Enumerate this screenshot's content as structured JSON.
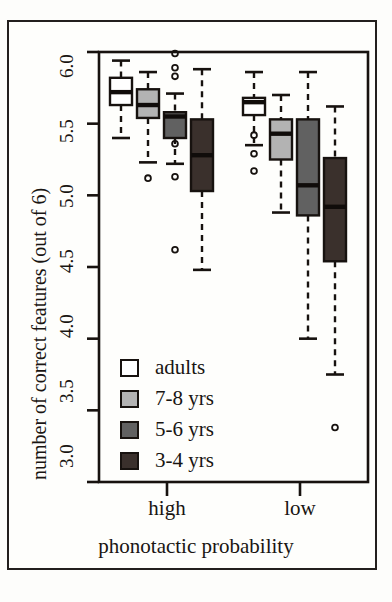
{
  "chart_data": {
    "type": "box",
    "title": "",
    "xlabel": "phonotactic probability",
    "ylabel": "number of correct features (out of 6)",
    "ylim": [
      3.0,
      6.0
    ],
    "yticks": [
      6.0,
      5.5,
      5.0,
      4.5,
      4.0,
      3.5,
      3.0
    ],
    "ytick_labels": [
      "6.0",
      "5.5",
      "5.0",
      "4.5",
      "4.0",
      "3.5",
      "3.0"
    ],
    "categories": [
      "high",
      "low"
    ],
    "grid": false,
    "legend_position": "bottom-left",
    "legend": [
      {
        "label": "adults",
        "color": "#ffffff"
      },
      {
        "label": "7-8 yrs",
        "color": "#b3b3b3"
      },
      {
        "label": "5-6 yrs",
        "color": "#616161"
      },
      {
        "label": "3-4 yrs",
        "color": "#3a302c"
      }
    ],
    "series": [
      {
        "name": "adults",
        "color": "#ffffff",
        "boxes": [
          {
            "category": "high",
            "whisker_low": 5.4,
            "q1": 5.63,
            "median": 5.72,
            "q3": 5.82,
            "whisker_high": 5.94,
            "outliers": []
          },
          {
            "category": "low",
            "whisker_low": 5.35,
            "q1": 5.56,
            "median": 5.65,
            "q3": 5.68,
            "whisker_high": 5.86,
            "outliers": [
              5.42,
              5.29,
              5.17
            ]
          }
        ]
      },
      {
        "name": "7-8 yrs",
        "color": "#b3b3b3",
        "boxes": [
          {
            "category": "high",
            "whisker_low": 5.23,
            "q1": 5.54,
            "median": 5.63,
            "q3": 5.74,
            "whisker_high": 5.86,
            "outliers": [
              5.12
            ]
          },
          {
            "category": "low",
            "whisker_low": 4.88,
            "q1": 5.25,
            "median": 5.43,
            "q3": 5.53,
            "whisker_high": 5.7,
            "outliers": []
          }
        ]
      },
      {
        "name": "5-6 yrs",
        "color": "#616161",
        "boxes": [
          {
            "category": "high",
            "whisker_low": 5.22,
            "q1": 5.4,
            "median": 5.55,
            "q3": 5.58,
            "whisker_high": 5.71,
            "outliers": [
              5.99,
              5.89,
              5.83,
              5.36,
              5.13,
              4.62
            ]
          },
          {
            "category": "low",
            "whisker_low": 4.0,
            "q1": 4.86,
            "median": 5.07,
            "q3": 5.53,
            "whisker_high": 5.86,
            "outliers": []
          }
        ]
      },
      {
        "name": "3-4 yrs",
        "color": "#3a302c",
        "boxes": [
          {
            "category": "high",
            "whisker_low": 4.48,
            "q1": 5.03,
            "median": 5.28,
            "q3": 5.53,
            "whisker_high": 5.88,
            "outliers": []
          },
          {
            "category": "low",
            "whisker_low": 3.75,
            "q1": 4.54,
            "median": 4.92,
            "q3": 5.26,
            "whisker_high": 5.62,
            "outliers": [
              3.38
            ]
          }
        ]
      }
    ]
  },
  "axes": {
    "y_title": "number of correct features (out of 6)",
    "x_title": "phonotactic probability",
    "y_tick_labels": [
      "6.0",
      "5.5",
      "5.0",
      "4.5",
      "4.0",
      "3.5",
      "3.0"
    ],
    "x_tick_labels": [
      "high",
      "low"
    ]
  },
  "legend": {
    "items": [
      {
        "label": "adults",
        "color": "#ffffff"
      },
      {
        "label": "7-8 yrs",
        "color": "#b3b3b3"
      },
      {
        "label": "5-6 yrs",
        "color": "#616161"
      },
      {
        "label": "3-4 yrs",
        "color": "#3a302c"
      }
    ]
  },
  "colors": {
    "axis": "#17120f",
    "background": "#fefefc",
    "frame": "#231f1e"
  }
}
